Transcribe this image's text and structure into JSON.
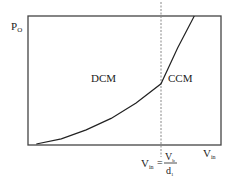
{
  "chart_data": {
    "type": "line",
    "title": "",
    "ylabel": {
      "main": "P",
      "sub": "O"
    },
    "xlabel": {
      "main": "V",
      "sub": "in"
    },
    "regions": [
      {
        "name": "DCM",
        "label": "DCM"
      },
      {
        "name": "CCM",
        "label": "CCM"
      }
    ],
    "boundary": {
      "lhs_main": "V",
      "lhs_sub": "in",
      "eq": "=",
      "num_main": "V",
      "num_sub": "b",
      "den_main": "d",
      "den_sub": "1",
      "x": 0.8
    },
    "xlim": [
      0,
      1
    ],
    "ylim": [
      0,
      1
    ],
    "series": [
      {
        "name": "Po-vs-Vin",
        "x": [
          0.05,
          0.2,
          0.35,
          0.5,
          0.65,
          0.8,
          0.9,
          1.0
        ],
        "y": [
          0.0,
          0.04,
          0.11,
          0.2,
          0.32,
          0.47,
          0.75,
          1.0
        ]
      }
    ],
    "grid": false
  }
}
